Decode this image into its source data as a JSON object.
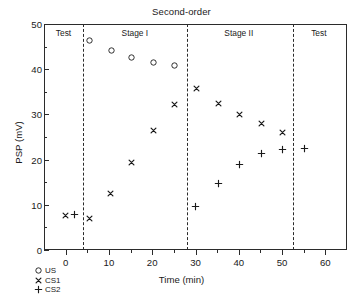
{
  "chart_data": {
    "type": "scatter",
    "title": "Second-order",
    "xlabel": "Time (min)",
    "ylabel": "PSP (mV)",
    "xlim": [
      -5,
      65
    ],
    "ylim": [
      0,
      50
    ],
    "xticks": [
      0,
      10,
      20,
      30,
      40,
      50,
      60
    ],
    "yticks": [
      0,
      10,
      20,
      30,
      40,
      50
    ],
    "xtick_labels": [
      "0",
      "10",
      "20",
      "30",
      "40",
      "50",
      "60"
    ],
    "ytick_labels": [
      "0",
      "10",
      "20",
      "30",
      "40",
      "50"
    ],
    "xtick_minor": [
      5,
      15,
      25,
      35,
      45,
      55
    ],
    "ytick_minor": [
      5,
      15,
      25,
      35,
      45
    ],
    "grid": false,
    "legend_position": "below-left",
    "phases": [
      {
        "label": "Test",
        "center_x": -0.5
      },
      {
        "label": "Stage I",
        "center_x": 16.0
      },
      {
        "label": "Stage II",
        "center_x": 40.0
      },
      {
        "label": "Test",
        "center_x": 58.5
      }
    ],
    "dividers": [
      4.0,
      28.0,
      52.5
    ],
    "series": [
      {
        "name": "US",
        "marker": "circle",
        "points": [
          {
            "x": 5.5,
            "y": 46.3
          },
          {
            "x": 10.5,
            "y": 44.1
          },
          {
            "x": 15.3,
            "y": 42.6
          },
          {
            "x": 20.3,
            "y": 41.4
          },
          {
            "x": 25.2,
            "y": 40.8
          }
        ]
      },
      {
        "name": "CS1",
        "marker": "cross-x",
        "points": [
          {
            "x": 0.0,
            "y": 7.7
          },
          {
            "x": 5.5,
            "y": 6.9
          },
          {
            "x": 10.3,
            "y": 12.5
          },
          {
            "x": 15.3,
            "y": 19.4
          },
          {
            "x": 20.3,
            "y": 26.5
          },
          {
            "x": 25.2,
            "y": 32.2
          },
          {
            "x": 30.2,
            "y": 35.8
          },
          {
            "x": 35.2,
            "y": 32.5
          },
          {
            "x": 40.2,
            "y": 30.0
          },
          {
            "x": 45.2,
            "y": 27.9
          },
          {
            "x": 50.2,
            "y": 26.0
          }
        ]
      },
      {
        "name": "CS2",
        "marker": "plus",
        "points": [
          {
            "x": 2.0,
            "y": 7.8
          },
          {
            "x": 30.0,
            "y": 9.6
          },
          {
            "x": 35.2,
            "y": 14.8
          },
          {
            "x": 40.2,
            "y": 18.9
          },
          {
            "x": 45.2,
            "y": 21.4
          },
          {
            "x": 50.2,
            "y": 22.3
          },
          {
            "x": 55.2,
            "y": 22.5
          }
        ]
      }
    ],
    "legend": [
      {
        "label": "US",
        "marker": "circle"
      },
      {
        "label": "CS1",
        "marker": "cross-x"
      },
      {
        "label": "CS2",
        "marker": "plus"
      }
    ],
    "colors": {
      "axis": "#2b2b2b",
      "marker": "#1a1a1a",
      "background": "#ffffff"
    }
  }
}
